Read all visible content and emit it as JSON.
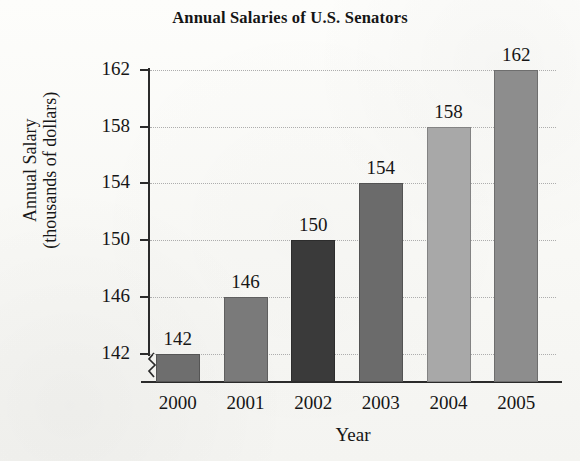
{
  "chart_data": {
    "type": "bar",
    "title": "Annual Salaries of U.S. Senators",
    "xlabel": "Year",
    "ylabel": "Annual Salary\n(thousands of dollars)",
    "ylabel_line1": "Annual Salary",
    "ylabel_line2": "(thousands of dollars)",
    "categories": [
      "2000",
      "2001",
      "2002",
      "2003",
      "2004",
      "2005"
    ],
    "values": [
      142,
      146,
      150,
      154,
      158,
      162
    ],
    "value_labels": [
      "142",
      "146",
      "150",
      "154",
      "158",
      "162"
    ],
    "ylim": [
      140,
      162
    ],
    "yticks": [
      142,
      146,
      150,
      154,
      158,
      162
    ],
    "ytick_labels": [
      "142",
      "146",
      "150",
      "154",
      "158",
      "162"
    ],
    "grid": "horizontal-dotted",
    "legend": "none",
    "axis_break": "y-axis-break-below-142",
    "bar_colors": [
      "#6e6e6e",
      "#7a7a7a",
      "#3a3a3a",
      "#6b6b6b",
      "#a8a8a8",
      "#8d8d8d"
    ],
    "axis_color": "#2b2b2b",
    "gridline_color": "#adadad",
    "background_color": "#fbfbf9"
  }
}
